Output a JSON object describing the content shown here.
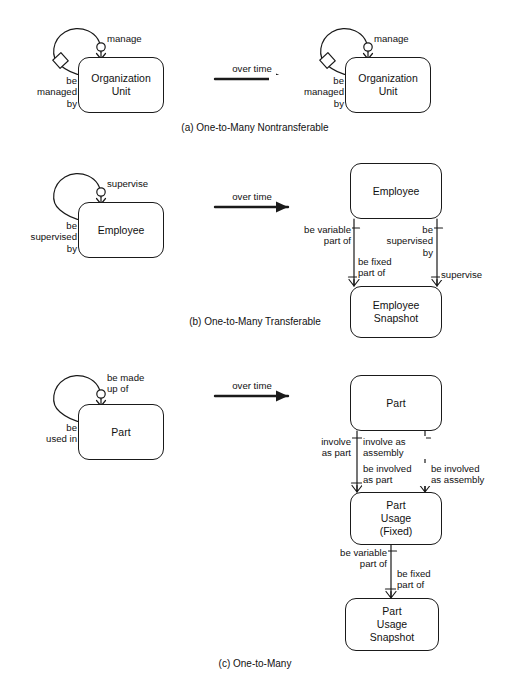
{
  "figure": {
    "transition_label": "over time"
  },
  "panels": [
    {
      "id": "a",
      "caption": "(a) One-to-Many Nontransferable",
      "transition": "over time",
      "before": {
        "entities": [
          {
            "key": "org_unit",
            "name": "Organization\nUnit"
          }
        ],
        "loop_labels": {
          "top": "manage",
          "side": "be\nmanaged\nby"
        }
      },
      "after": {
        "entities": [
          {
            "key": "org_unit",
            "name": "Organization\nUnit"
          }
        ],
        "loop_labels": {
          "top": "manage",
          "side": "be\nmanaged\nby"
        }
      }
    },
    {
      "id": "b",
      "caption": "(b) One-to-Many Transferable",
      "transition": "over time",
      "before": {
        "entities": [
          {
            "key": "employee",
            "name": "Employee"
          }
        ],
        "loop_labels": {
          "top": "supervise",
          "side": "be\nsupervised\nby"
        }
      },
      "after": {
        "entities": [
          {
            "key": "employee",
            "name": "Employee"
          },
          {
            "key": "employee_snapshot",
            "name": "Employee\nSnapshot"
          }
        ],
        "edge_labels": [
          {
            "key": "left_upper",
            "text": "be variable\npart of"
          },
          {
            "key": "left_lower",
            "text": "be fixed\npart of"
          },
          {
            "key": "right_upper",
            "text": "be\nsupervised\nby"
          },
          {
            "key": "right_lower",
            "text": "supervise"
          }
        ]
      }
    },
    {
      "id": "c",
      "caption": "(c) One-to-Many",
      "transition": "over time",
      "before": {
        "entities": [
          {
            "key": "part",
            "name": "Part"
          }
        ],
        "loop_labels": {
          "top": "be made\nup of",
          "side": "be\nused in"
        }
      },
      "after": {
        "entities": [
          {
            "key": "part",
            "name": "Part"
          },
          {
            "key": "part_usage_fixed",
            "name": "Part\nUsage\n(Fixed)"
          },
          {
            "key": "part_usage_snapshot",
            "name": "Part\nUsage\nSnapshot"
          }
        ],
        "edge_labels": [
          {
            "key": "c_left_upper",
            "text": "involve\nas part"
          },
          {
            "key": "c_mid_upper",
            "text": "involve as\nassembly"
          },
          {
            "key": "c_left_lower",
            "text": "be involved\nas part"
          },
          {
            "key": "c_right_lower",
            "text": "be involved\nas assembly"
          },
          {
            "key": "c_snap_left",
            "text": "be variable\npart of"
          },
          {
            "key": "c_snap_right",
            "text": "be fixed\npart of"
          }
        ]
      }
    }
  ],
  "colors": {
    "stroke": "#1a1a1a",
    "background": "#ffffff",
    "text": "#111111"
  }
}
